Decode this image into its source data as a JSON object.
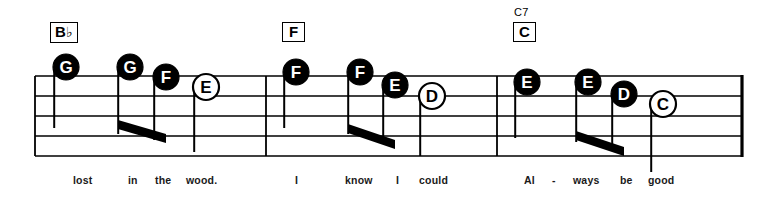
{
  "sheet": {
    "title": "Music staff excerpt with note-name noteheads",
    "width": 773,
    "height": 200,
    "ink_color": "#000000",
    "paper_color": "#ffffff"
  },
  "staff": {
    "line_count": 5,
    "left": 35,
    "right": 742,
    "top": 76,
    "bottom": 156,
    "line_spacing": 20,
    "barlines": [
      266,
      497
    ],
    "end_barline": 742
  },
  "chords": [
    {
      "name": "chord-bb",
      "box_label": "B",
      "accidental": "♭",
      "superscript": "",
      "x": 50,
      "y": 22
    },
    {
      "name": "chord-f",
      "box_label": "F",
      "accidental": "",
      "superscript": "",
      "x": 282,
      "y": 22
    },
    {
      "name": "chord-c7",
      "box_label": "C",
      "accidental": "",
      "superscript": "C7",
      "x": 513,
      "y": 22
    }
  ],
  "measures": [
    {
      "number": 1,
      "lyrics": [
        {
          "text": "lost",
          "x": 73
        },
        {
          "text": "in",
          "x": 128
        },
        {
          "text": "the",
          "x": 155
        },
        {
          "text": "wood.",
          "x": 186
        }
      ],
      "notes": [
        {
          "letter": "G",
          "head": "filled",
          "x": 66,
          "y": 67,
          "stem": "down",
          "stem_to": 128,
          "beam": null
        },
        {
          "letter": "G",
          "head": "filled",
          "x": 130,
          "y": 67,
          "stem": "down",
          "stem_to": 134,
          "beam": "left"
        },
        {
          "letter": "F",
          "head": "filled",
          "x": 166,
          "y": 77,
          "stem": "down",
          "stem_to": 140,
          "beam": "right"
        },
        {
          "letter": "E",
          "head": "hollow",
          "x": 206,
          "y": 87,
          "stem": "down",
          "stem_to": 152,
          "beam": null
        }
      ],
      "beams": [
        {
          "x1": 118,
          "y1": 120,
          "x2": 166,
          "y2": 134
        }
      ]
    },
    {
      "number": 2,
      "lyrics": [
        {
          "text": "I",
          "x": 295
        },
        {
          "text": "know",
          "x": 345
        },
        {
          "text": "I",
          "x": 396
        },
        {
          "text": "could",
          "x": 419
        }
      ],
      "notes": [
        {
          "letter": "F",
          "head": "filled",
          "x": 296,
          "y": 72,
          "stem": "down",
          "stem_to": 128,
          "beam": null
        },
        {
          "letter": "F",
          "head": "filled",
          "x": 360,
          "y": 72,
          "stem": "down",
          "stem_to": 134,
          "beam": "left"
        },
        {
          "letter": "E",
          "head": "filled",
          "x": 395,
          "y": 85,
          "stem": "down",
          "stem_to": 142,
          "beam": "right"
        },
        {
          "letter": "D",
          "head": "hollow",
          "x": 432,
          "y": 96,
          "stem": "down",
          "stem_to": 156,
          "beam": null
        }
      ],
      "beams": [
        {
          "x1": 348,
          "y1": 124,
          "x2": 395,
          "y2": 140
        }
      ]
    },
    {
      "number": 3,
      "lyrics": [
        {
          "text": "Al",
          "x": 524
        },
        {
          "text": "-",
          "x": 552
        },
        {
          "text": "ways",
          "x": 573
        },
        {
          "text": "be",
          "x": 620
        },
        {
          "text": "good",
          "x": 648
        }
      ],
      "notes": [
        {
          "letter": "E",
          "head": "filled",
          "x": 527,
          "y": 82,
          "stem": "down",
          "stem_to": 138,
          "beam": null
        },
        {
          "letter": "E",
          "head": "filled",
          "x": 588,
          "y": 82,
          "stem": "down",
          "stem_to": 142,
          "beam": "left"
        },
        {
          "letter": "D",
          "head": "filled",
          "x": 624,
          "y": 94,
          "stem": "down",
          "stem_to": 148,
          "beam": "right"
        },
        {
          "letter": "C",
          "head": "hollow",
          "x": 663,
          "y": 104,
          "stem": "down",
          "stem_to": 172,
          "beam": null
        }
      ],
      "beams": [
        {
          "x1": 576,
          "y1": 131,
          "x2": 624,
          "y2": 147
        }
      ]
    }
  ]
}
